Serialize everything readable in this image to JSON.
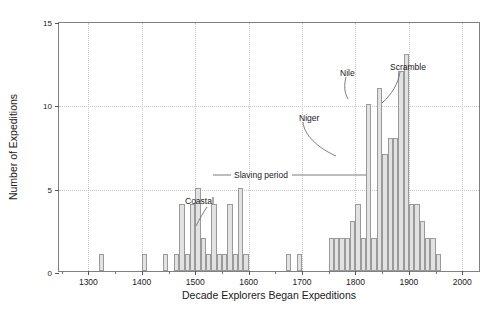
{
  "chart_data": {
    "type": "bar",
    "title": "",
    "xlabel": "Decade Explorers Began Expeditions",
    "ylabel": "Number of Expeditions",
    "xlim": [
      1245,
      2035
    ],
    "ylim": [
      0,
      15
    ],
    "bin_width": 10,
    "grid": true,
    "legend": "none",
    "yticks": [
      0,
      5,
      10,
      15
    ],
    "ytick_labels": [
      "0",
      "5",
      "10",
      "15"
    ],
    "xticks": [
      1300,
      1400,
      1500,
      1600,
      1700,
      1800,
      1900,
      2000
    ],
    "xtick_labels": [
      "1300",
      "1400",
      "1500",
      "1600",
      "1700",
      "1800",
      "1900",
      "2000"
    ],
    "xticks_minor": [
      1250,
      1350,
      1450,
      1550,
      1650,
      1750,
      1850,
      1950
    ],
    "categories": [
      1320,
      1400,
      1440,
      1460,
      1470,
      1480,
      1490,
      1500,
      1510,
      1520,
      1530,
      1540,
      1550,
      1560,
      1570,
      1580,
      1590,
      1670,
      1690,
      1750,
      1760,
      1770,
      1780,
      1790,
      1800,
      1810,
      1820,
      1830,
      1840,
      1850,
      1860,
      1870,
      1880,
      1890,
      1900,
      1910,
      1920,
      1930,
      1940,
      1950
    ],
    "values": [
      1,
      1,
      1,
      1,
      4,
      1,
      4,
      5,
      2,
      1,
      4,
      1,
      1,
      4,
      1,
      5,
      1,
      1,
      1,
      2,
      2,
      2,
      2,
      3,
      4,
      2,
      10,
      2,
      11,
      7,
      8,
      8,
      12,
      13,
      4,
      4,
      3,
      2,
      2,
      1
    ],
    "annotations": [
      {
        "name": "coastal",
        "text": "Coastal",
        "label_x": 185,
        "label_y": 196,
        "leader": "M 207 207 C 203 213 200 218 196 226"
      },
      {
        "name": "slaving-period",
        "text": "Slaving period",
        "label_x": 234,
        "label_y": 170,
        "line_left_x1": 213,
        "line_left_x2": 231,
        "line_right_x1": 292,
        "line_right_x2": 366,
        "line_y": 175
      },
      {
        "name": "niger",
        "text": "Niger",
        "label_x": 299,
        "label_y": 113,
        "leader": "M 303 122 C 304 135 318 148 336 156"
      },
      {
        "name": "nile",
        "text": "Nile",
        "label_x": 340,
        "label_y": 68,
        "leader": "M 346 77 C 344 85 344 92 348 99"
      },
      {
        "name": "scramble",
        "text": "Scramble",
        "label_x": 390,
        "label_y": 62,
        "leader": "M 400 72 C 398 84 392 94 382 103"
      }
    ]
  },
  "colors": {
    "bar_fill": "#e2e2e2",
    "bar_edge": "#9a9a9a",
    "axis": "#808080",
    "grid": "#c8c8c8",
    "text": "#1a1a1a",
    "annotation_line": "#6e6e6e"
  }
}
